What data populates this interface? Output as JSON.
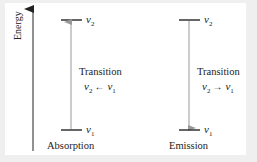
{
  "diagram": {
    "axis": {
      "label": "Energy"
    },
    "colors": {
      "background": "#efefef",
      "panel": "#ffffff",
      "level_line": "#333333",
      "axis_line": "#222222",
      "transition_arrow": "#999999",
      "text": "#222222"
    },
    "panels": [
      {
        "name": "absorption",
        "caption": "Absorption",
        "upper_level": {
          "symbol": "v",
          "subscript": "2"
        },
        "lower_level": {
          "symbol": "v",
          "subscript": "1"
        },
        "transition_title": "Transition",
        "transition_label": {
          "left_symbol": "v",
          "left_sub": "2",
          "arrow": "←",
          "right_symbol": "v",
          "right_sub": "1"
        },
        "arrow_direction": "up"
      },
      {
        "name": "emission",
        "caption": "Emission",
        "upper_level": {
          "symbol": "v",
          "subscript": "2"
        },
        "lower_level": {
          "symbol": "v",
          "subscript": "1"
        },
        "transition_title": "Transition",
        "transition_label": {
          "left_symbol": "v",
          "left_sub": "2",
          "arrow": "→",
          "right_symbol": "v",
          "right_sub": "1"
        },
        "arrow_direction": "down"
      }
    ]
  }
}
